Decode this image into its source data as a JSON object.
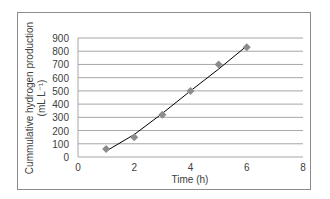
{
  "chart_data": {
    "type": "scatter",
    "title": "",
    "xlabel": "Time (h)",
    "ylabel": "Cummulative hydrogen production (mL L⁻¹)",
    "ylabel_line1": "Cummulative hydrogen production",
    "ylabel_line2": "(mL L⁻¹)",
    "xlim": [
      0,
      8
    ],
    "ylim": [
      0,
      900
    ],
    "x_ticks": [
      0,
      2,
      4,
      6,
      8
    ],
    "y_ticks": [
      0,
      100,
      200,
      300,
      400,
      500,
      600,
      700,
      800,
      900
    ],
    "grid": "horizontal",
    "legend": "none",
    "series": [
      {
        "name": "Observed",
        "marker": "diamond",
        "color": "#8c8c8c",
        "x": [
          1,
          2,
          3,
          4,
          5,
          6
        ],
        "y": [
          60,
          150,
          320,
          500,
          700,
          830
        ]
      },
      {
        "name": "Fitted curve",
        "type": "line",
        "color": "#000000",
        "x": [
          1,
          2,
          3,
          4,
          5,
          6
        ],
        "y": [
          45,
          170,
          330,
          500,
          665,
          840
        ]
      }
    ]
  }
}
